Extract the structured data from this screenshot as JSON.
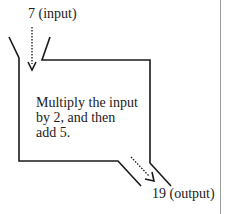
{
  "diagram": {
    "input_label": "7 (input)",
    "output_label": "19 (output)",
    "rule_text": "Multiply the input\nby 2, and then\nadd 5.",
    "colors": {
      "line": "#1a1a1a",
      "divider": "#9a9a9a",
      "background": "#ffffff"
    }
  }
}
